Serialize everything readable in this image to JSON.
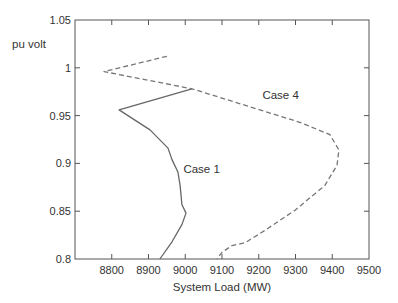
{
  "chart_data": {
    "type": "line",
    "title": "",
    "xlabel": "System Load (MW)",
    "ylabel": "pu volt",
    "xlim": [
      8700,
      9500
    ],
    "ylim": [
      0.8,
      1.05
    ],
    "xticks": [
      8800,
      8900,
      9000,
      9100,
      9200,
      9300,
      9400,
      9500
    ],
    "yticks": [
      0.8,
      0.85,
      0.9,
      0.95,
      1,
      1.05
    ],
    "xtick_labels": [
      "8800",
      "8900",
      "9000",
      "9100",
      "9200",
      "9300",
      "9400",
      "9500"
    ],
    "ytick_labels": [
      "0.8",
      "0.85",
      "0.9",
      "0.95",
      "1",
      "1.05"
    ],
    "grid": false,
    "legend": "none (inline labels)",
    "series": [
      {
        "name": "Case 1",
        "style": "solid",
        "color": "#666666",
        "label_pos": [
          8995,
          0.89
        ],
        "points": [
          [
            9018,
            0.978
          ],
          [
            8820,
            0.956
          ],
          [
            8904,
            0.935
          ],
          [
            8953,
            0.916
          ],
          [
            8964,
            0.904
          ],
          [
            8980,
            0.891
          ],
          [
            8986,
            0.877
          ],
          [
            8991,
            0.857
          ],
          [
            9002,
            0.848
          ],
          [
            8991,
            0.836
          ],
          [
            8964,
            0.818
          ],
          [
            8931,
            0.8
          ]
        ]
      },
      {
        "name": "Case 4",
        "style": "dashed",
        "color": "#777777",
        "label_pos": [
          9210,
          0.967
        ],
        "points": [
          [
            8950,
            1.012
          ],
          [
            8779,
            0.996
          ],
          [
            9018,
            0.978
          ],
          [
            9203,
            0.956
          ],
          [
            9312,
            0.943
          ],
          [
            9394,
            0.93
          ],
          [
            9418,
            0.914
          ],
          [
            9413,
            0.898
          ],
          [
            9380,
            0.877
          ],
          [
            9299,
            0.851
          ],
          [
            9217,
            0.83
          ],
          [
            9163,
            0.817
          ],
          [
            9127,
            0.814
          ],
          [
            9100,
            0.807
          ],
          [
            9086,
            0.8
          ]
        ]
      }
    ]
  }
}
